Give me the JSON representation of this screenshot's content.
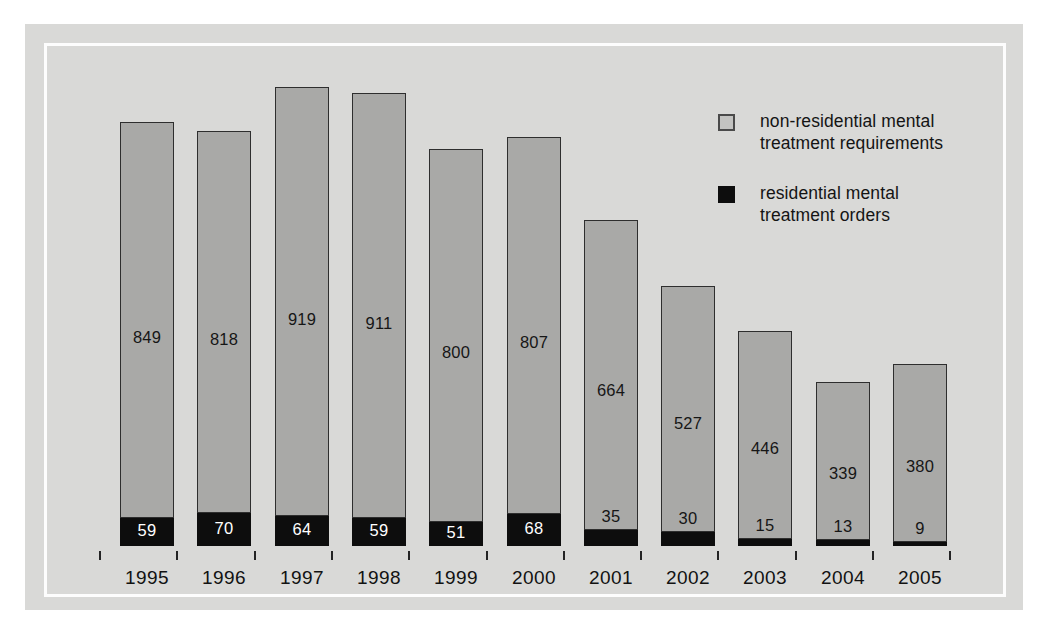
{
  "chart_data": {
    "type": "bar",
    "subtype": "stacked-bar",
    "title": "",
    "subtitle": "",
    "xlabel": "",
    "ylabel": "",
    "categories": [
      "1995",
      "1996",
      "1997",
      "1998",
      "1999",
      "2000",
      "2001",
      "2002",
      "2003",
      "2004",
      "2005"
    ],
    "series": [
      {
        "name": "non-residential mental treatment requirements",
        "color": "#a9a9a7",
        "values": [
          849,
          818,
          919,
          911,
          800,
          807,
          664,
          527,
          446,
          339,
          380
        ]
      },
      {
        "name": "residential mental treatment orders",
        "color": "#0d0d0d",
        "values": [
          59,
          70,
          64,
          59,
          51,
          68,
          35,
          30,
          15,
          13,
          9
        ]
      }
    ],
    "totals": [
      908,
      888,
      983,
      970,
      851,
      875,
      699,
      557,
      461,
      352,
      389
    ],
    "ylim": [
      0,
      983
    ],
    "grid": false,
    "legend_position": "top-right",
    "data_labels": true,
    "annotations": []
  },
  "legend": {
    "items": [
      {
        "swatch": "light-gray-square",
        "line1": "non-residential mental",
        "line2": "treatment requirements"
      },
      {
        "swatch": "black-square",
        "line1": "residential mental",
        "line2": "treatment orders"
      }
    ]
  },
  "colors": {
    "page_background": "#ffffff",
    "panel_background": "#d9d9d7",
    "inner_rule": "#fdfdfd",
    "bar_light": "#a9a9a7",
    "bar_dark": "#0d0d0d",
    "bar_outline": "#2e2e2e",
    "label_dark": "#161616",
    "label_light": "#ffffff",
    "axis_tick": "#242424"
  }
}
